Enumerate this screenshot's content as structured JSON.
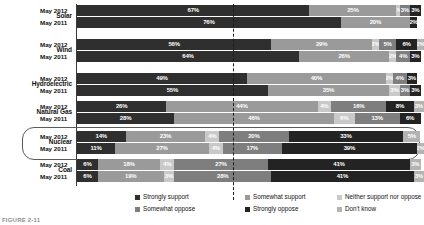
{
  "chart_data": {
    "type": "bar",
    "orientation": "horizontal",
    "stacked": true,
    "stack_total": 100,
    "unit": "%",
    "title": "",
    "xlabel": "",
    "ylabel": "",
    "xlim": [
      0,
      100
    ],
    "grid": false,
    "legend_position": "bottom",
    "annotations": [
      {
        "type": "vertical-dashed-line",
        "value": 50,
        "label": ""
      },
      {
        "type": "highlight-capsule",
        "category": "Nuclear"
      }
    ],
    "series": [
      {
        "name": "Strongly support",
        "color": "#2f2f2f"
      },
      {
        "name": "Somewhat support",
        "color": "#9a9a9a"
      },
      {
        "name": "Neither support nor oppose",
        "color": "#c9c9c9"
      },
      {
        "name": "Somewhat oppose",
        "color": "#7e7e7e"
      },
      {
        "name": "Strongly oppose",
        "color": "#232323"
      },
      {
        "name": "Don't know",
        "color": "#b3b3b3"
      }
    ],
    "categories": [
      "Solar",
      "Wind",
      "Hydroelectric",
      "Natural Gas",
      "Nuclear",
      "Coal"
    ],
    "rows": [
      {
        "category": "Solar",
        "highlight": false,
        "series_rows": [
          {
            "label": "May 2012",
            "values": [
              67,
              25,
              1,
              3,
              3,
              0
            ],
            "labels": [
              "67%",
              "25%",
              "1%",
              "3%",
              "3%",
              ""
            ]
          },
          {
            "label": "May 2011",
            "values": [
              76,
              20,
              0,
              0,
              2,
              0
            ],
            "labels": [
              "76%",
              "20%",
              "",
              "",
              "2%",
              ""
            ]
          }
        ]
      },
      {
        "category": "Wind",
        "highlight": false,
        "series_rows": [
          {
            "label": "May 2012",
            "values": [
              56,
              29,
              2,
              5,
              6,
              2
            ],
            "labels": [
              "56%",
              "29%",
              "2%",
              "5%",
              "6%",
              "2%"
            ]
          },
          {
            "label": "May 2011",
            "values": [
              64,
              26,
              2,
              4,
              3,
              0
            ],
            "labels": [
              "64%",
              "26%",
              "2%",
              "4%",
              "3%",
              ""
            ]
          }
        ]
      },
      {
        "category": "Hydroelectric",
        "highlight": false,
        "series_rows": [
          {
            "label": "May 2012",
            "values": [
              49,
              40,
              2,
              4,
              3,
              0
            ],
            "labels": [
              "49%",
              "40%",
              "2%",
              "4%",
              "3%",
              ""
            ]
          },
          {
            "label": "May 2011",
            "values": [
              55,
              35,
              3,
              3,
              3,
              0
            ],
            "labels": [
              "55%",
              "35%",
              "3%",
              "3%",
              "3%",
              ""
            ]
          }
        ]
      },
      {
        "category": "Natural Gas",
        "highlight": false,
        "series_rows": [
          {
            "label": "May 2012",
            "values": [
              26,
              44,
              4,
              16,
              8,
              3
            ],
            "labels": [
              "26%",
              "44%",
              "4%",
              "16%",
              "8%",
              "3%"
            ]
          },
          {
            "label": "May 2011",
            "values": [
              28,
              46,
              6,
              13,
              6,
              0
            ],
            "labels": [
              "28%",
              "46%",
              "6%",
              "13%",
              "6%",
              ""
            ]
          }
        ]
      },
      {
        "category": "Nuclear",
        "highlight": true,
        "series_rows": [
          {
            "label": "May 2012",
            "values": [
              14,
              23,
              4,
              20,
              33,
              5
            ],
            "labels": [
              "14%",
              "23%",
              "4%",
              "20%",
              "33%",
              "5%"
            ]
          },
          {
            "label": "May 2011",
            "values": [
              11,
              27,
              4,
              17,
              39,
              2
            ],
            "labels": [
              "11%",
              "27%",
              "4%",
              "17%",
              "39%",
              "2%"
            ]
          }
        ]
      },
      {
        "category": "Coal",
        "highlight": false,
        "series_rows": [
          {
            "label": "May 2012",
            "values": [
              6,
              18,
              4,
              27,
              41,
              3
            ],
            "labels": [
              "6%",
              "18%",
              "4%",
              "27%",
              "41%",
              "3%"
            ]
          },
          {
            "label": "May 2011",
            "values": [
              6,
              19,
              3,
              28,
              41,
              3
            ],
            "labels": [
              "6%",
              "19%",
              "3%",
              "28%",
              "41%",
              "3%"
            ]
          }
        ]
      }
    ]
  },
  "legend": {
    "items": [
      {
        "label": "Strongly support"
      },
      {
        "label": "Somewhat support"
      },
      {
        "label": "Neither support nor oppose"
      },
      {
        "label": "Somewhat oppose"
      },
      {
        "label": "Strongly oppose"
      },
      {
        "label": "Don't know"
      }
    ]
  },
  "footer": {
    "note": "FIGURE 2-11"
  }
}
